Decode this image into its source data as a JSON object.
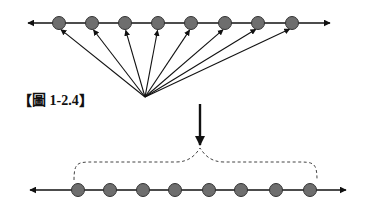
{
  "caption": "【圖 1-2.4】",
  "colors": {
    "line": "#111111",
    "dot_fill": "#6e6e6e",
    "dot_stroke": "#333333",
    "dashed": "#444444"
  },
  "top_axis": {
    "y": 23,
    "x_start": 24,
    "x_end": 334,
    "dots_x": [
      59,
      92,
      125,
      158,
      191,
      225,
      258,
      292
    ],
    "dot_radius": 6.5
  },
  "fan": {
    "origin": [
      145,
      97
    ],
    "count": 8
  },
  "down_arrow": {
    "x": 200,
    "y_start": 104,
    "y_end": 145
  },
  "brace": {
    "x_left": 74,
    "x_right": 317,
    "y_top": 162,
    "peak": [
      200,
      148
    ],
    "y_bottom": 180
  },
  "bottom_axis": {
    "y": 190,
    "x_start": 26,
    "x_end": 350,
    "dots_x": [
      78,
      110,
      143,
      175,
      209,
      241,
      276,
      310
    ],
    "dot_radius": 6.5
  }
}
